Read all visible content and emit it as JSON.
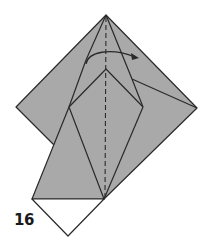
{
  "diagram": {
    "step_number": "16",
    "colors": {
      "paper_colored": "#a9a9a9",
      "paper_white": "#ffffff",
      "line": "#2a2a2a",
      "background": "#ffffff"
    },
    "elements": {
      "valley_fold_line": "vertical dashed center crease",
      "arrow": "curved arrow indicating fold from left to right"
    }
  }
}
